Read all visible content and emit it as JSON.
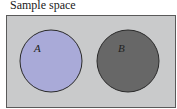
{
  "diagram": {
    "title": "Sample space",
    "type": "venn",
    "colors": {
      "background": "#c9cacb",
      "border": "#5a5a5a",
      "set_a_fill": "#a9aad8",
      "set_b_fill": "#676767",
      "circle_stroke": "#2a2a2a"
    },
    "sets": [
      {
        "label": "A",
        "cx": 51,
        "cy": 61,
        "r": 31
      },
      {
        "label": "B",
        "cx": 128,
        "cy": 61,
        "r": 31
      }
    ],
    "relation": "disjoint"
  }
}
